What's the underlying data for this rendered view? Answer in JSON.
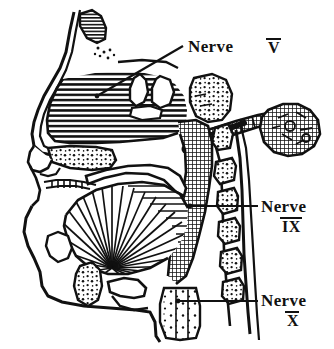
{
  "figure": {
    "type": "anatomical-line-drawing",
    "background_color": "#ffffff",
    "ink_color": "#111111",
    "width": 334,
    "height": 349
  },
  "labels": [
    {
      "id": "nerve-v",
      "text": "Nerve",
      "numeral": "V",
      "overline": true,
      "text_x": 188,
      "text_y": 52,
      "numeral_x": 268,
      "numeral_y": 53,
      "leader": {
        "x1": 183,
        "y1": 46,
        "x2": 97,
        "y2": 96
      },
      "dot": {
        "cx": 97,
        "cy": 96,
        "r": 2.4
      }
    },
    {
      "id": "nerve-ix",
      "text": "Nerve",
      "numeral": "IX",
      "overline": true,
      "text_x": 261,
      "text_y": 212,
      "numeral_x": 282,
      "numeral_y": 232,
      "leader": {
        "x1": 258,
        "y1": 206,
        "x2": 190,
        "y2": 206
      },
      "dot": {
        "cx": 190,
        "cy": 206,
        "r": 2.4
      }
    },
    {
      "id": "nerve-x",
      "text": "Nerve",
      "numeral": "X",
      "overline": true,
      "text_x": 261,
      "text_y": 306,
      "numeral_x": 287,
      "numeral_y": 326,
      "leader": {
        "x1": 258,
        "y1": 301,
        "x2": 178,
        "y2": 301
      },
      "dot": {
        "cx": 178,
        "cy": 301,
        "r": 2.4
      }
    }
  ],
  "structures": [
    {
      "id": "frontal-sinus",
      "name": "frontal sinus",
      "fill": "horizontal-hatch"
    },
    {
      "id": "nasal-cavity",
      "name": "nasal cavity and turbinates",
      "fill": "horizontal-hatch"
    },
    {
      "id": "hard-palate",
      "name": "hard palate",
      "fill": "stipple"
    },
    {
      "id": "sphenoid-region",
      "name": "sphenoid / skull base",
      "fill": "stipple"
    },
    {
      "id": "tongue",
      "name": "tongue with radiating muscle fibers",
      "fill": "radiating-lines"
    },
    {
      "id": "soft-palate",
      "name": "soft palate",
      "fill": "white"
    },
    {
      "id": "pharyngeal-wall",
      "name": "pharyngeal wall",
      "fill": "cross-hatch"
    },
    {
      "id": "parotid-gland",
      "name": "parotid gland",
      "fill": "cross-hatch"
    },
    {
      "id": "parotid-duct",
      "name": "parotid duct",
      "fill": "cross-hatch"
    },
    {
      "id": "nerve-trunk",
      "name": "nerve trunk",
      "fill": "solid-black"
    },
    {
      "id": "cervical-vertebrae",
      "name": "cervical vertebrae",
      "fill": "stipple"
    },
    {
      "id": "hyoid-bone",
      "name": "hyoid bone",
      "fill": "stipple"
    },
    {
      "id": "epiglottis",
      "name": "epiglottis",
      "fill": "white"
    },
    {
      "id": "esophagus",
      "name": "esophagus and trachea",
      "fill": "stipple"
    },
    {
      "id": "mandible",
      "name": "mandible and chin profile",
      "fill": "white"
    }
  ]
}
